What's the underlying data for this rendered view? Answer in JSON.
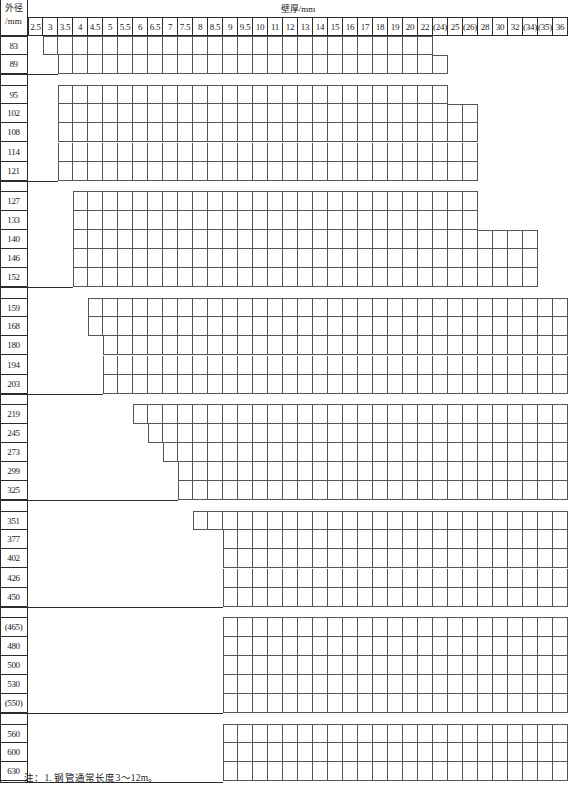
{
  "table": {
    "row_header_label_line1": "外径",
    "row_header_label_line2": "/mm",
    "column_group_title": "壁厚/mm",
    "wall_thickness_columns": [
      "2.5",
      "3",
      "3.5",
      "4",
      "4.5",
      "5",
      "5.5",
      "6",
      "6.5",
      "7",
      "7.5",
      "8",
      "8.5",
      "9",
      "9.5",
      "10",
      "11",
      "12",
      "13",
      "14",
      "15",
      "16",
      "17",
      "18",
      "19",
      "20",
      "22",
      "(24)",
      "25",
      "(26)",
      "28",
      "30",
      "32",
      "(34)",
      "(35)",
      "36"
    ],
    "outer_diameter_rows": [
      "83",
      "89",
      "95",
      "102",
      "108",
      "114",
      "121",
      "127",
      "133",
      "140",
      "146",
      "152",
      "159",
      "168",
      "180",
      "194",
      "203",
      "219",
      "245",
      "273",
      "299",
      "325",
      "351",
      "377",
      "402",
      "426",
      "450",
      "(465)",
      "480",
      "500",
      "530",
      "(550)",
      "560",
      "600",
      "630"
    ],
    "availability": [
      {
        "od": "83",
        "start_col": 1,
        "end_col": 26
      },
      {
        "od": "89",
        "start_col": 2,
        "end_col": 27
      },
      {
        "od": "95",
        "start_col": 2,
        "end_col": 27
      },
      {
        "od": "102",
        "start_col": 2,
        "end_col": 29
      },
      {
        "od": "108",
        "start_col": 2,
        "end_col": 29
      },
      {
        "od": "114",
        "start_col": 2,
        "end_col": 29
      },
      {
        "od": "121",
        "start_col": 2,
        "end_col": 29
      },
      {
        "od": "127",
        "start_col": 3,
        "end_col": 29
      },
      {
        "od": "133",
        "start_col": 3,
        "end_col": 29
      },
      {
        "od": "140",
        "start_col": 3,
        "end_col": 33
      },
      {
        "od": "146",
        "start_col": 3,
        "end_col": 33
      },
      {
        "od": "152",
        "start_col": 3,
        "end_col": 33
      },
      {
        "od": "159",
        "start_col": 4,
        "end_col": 35
      },
      {
        "od": "168",
        "start_col": 4,
        "end_col": 35
      },
      {
        "od": "180",
        "start_col": 5,
        "end_col": 35
      },
      {
        "od": "194",
        "start_col": 5,
        "end_col": 35
      },
      {
        "od": "203",
        "start_col": 5,
        "end_col": 35
      },
      {
        "od": "219",
        "start_col": 7,
        "end_col": 35
      },
      {
        "od": "245",
        "start_col": 8,
        "end_col": 35
      },
      {
        "od": "273",
        "start_col": 9,
        "end_col": 35
      },
      {
        "od": "299",
        "start_col": 10,
        "end_col": 35
      },
      {
        "od": "325",
        "start_col": 10,
        "end_col": 35
      },
      {
        "od": "351",
        "start_col": 11,
        "end_col": 35
      },
      {
        "od": "377",
        "start_col": 13,
        "end_col": 35
      },
      {
        "od": "402",
        "start_col": 13,
        "end_col": 35
      },
      {
        "od": "426",
        "start_col": 13,
        "end_col": 35
      },
      {
        "od": "450",
        "start_col": 13,
        "end_col": 35
      },
      {
        "od": "(465)",
        "start_col": 13,
        "end_col": 35
      },
      {
        "od": "480",
        "start_col": 13,
        "end_col": 35
      },
      {
        "od": "500",
        "start_col": 13,
        "end_col": 35
      },
      {
        "od": "530",
        "start_col": 13,
        "end_col": 35
      },
      {
        "od": "(550)",
        "start_col": 13,
        "end_col": 35
      },
      {
        "od": "560",
        "start_col": 13,
        "end_col": 35
      },
      {
        "od": "600",
        "start_col": 13,
        "end_col": 35
      },
      {
        "od": "630",
        "start_col": 13,
        "end_col": 35
      }
    ],
    "group_breaks_after": [
      "89",
      "121",
      "152",
      "203",
      "325",
      "450",
      "(550)"
    ]
  },
  "note": {
    "text": "注：1. 钢管通常长度3～12m。"
  },
  "style": {
    "grid_line": "#555555",
    "frame_line": "#2b2b2b",
    "text": "#1a1a1a"
  }
}
